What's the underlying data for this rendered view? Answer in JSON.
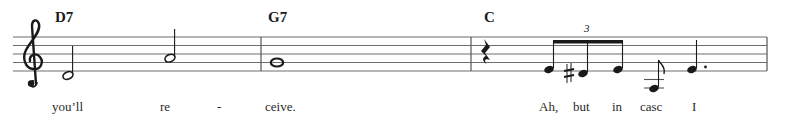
{
  "score": {
    "clef": "treble",
    "colors": {
      "ink": "#1a1a1a",
      "staff": "#6e6e6e",
      "background": "#ffffff"
    },
    "chords": [
      {
        "label": "D7",
        "x": 55
      },
      {
        "label": "G7",
        "x": 268
      },
      {
        "label": "C",
        "x": 484
      }
    ],
    "measures": [
      {
        "number": 1,
        "chord": "D7",
        "notes": [
          {
            "pitch": "D4",
            "duration": "half"
          },
          {
            "pitch": "A4",
            "duration": "half"
          }
        ]
      },
      {
        "number": 2,
        "chord": "G7",
        "notes": [
          {
            "pitch": "G4",
            "duration": "whole"
          }
        ]
      },
      {
        "number": 3,
        "chord": "C",
        "notes": [
          {
            "pitch": "rest",
            "duration": "quarter"
          },
          {
            "pitch": "E4",
            "duration": "eighth-triplet"
          },
          {
            "pitch": "D#4",
            "duration": "eighth-triplet",
            "accidental": "sharp"
          },
          {
            "pitch": "E4",
            "duration": "eighth-triplet"
          },
          {
            "pitch": "G3",
            "duration": "eighth"
          },
          {
            "pitch": "E4",
            "duration": "dotted-quarter"
          }
        ]
      }
    ],
    "tuplet_label": "3",
    "lyrics": [
      {
        "text": "you’ll",
        "x": 52
      },
      {
        "text": "re",
        "x": 160
      },
      {
        "text": "-",
        "x": 217
      },
      {
        "text": "ceive.",
        "x": 265
      },
      {
        "text": "Ah,",
        "x": 539
      },
      {
        "text": "but",
        "x": 573
      },
      {
        "text": "in",
        "x": 612
      },
      {
        "text": "casc",
        "x": 640
      },
      {
        "text": "I",
        "x": 692
      }
    ]
  }
}
